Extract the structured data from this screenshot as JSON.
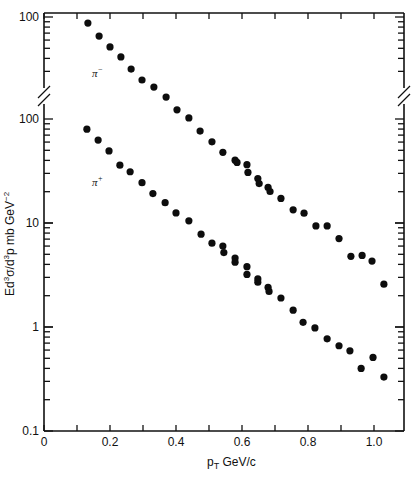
{
  "chart_data": {
    "type": "scatter",
    "title": "",
    "xlabel": "p_T GeV/c",
    "xlabel_display": "pT GeV/c",
    "ylabel": "Ed³σ/d³p mb GeV⁻²",
    "x_scale": "linear",
    "y_scale": "log",
    "xlim": [
      0,
      1.1
    ],
    "ylim": [
      0.1,
      100
    ],
    "x_ticks": [
      0,
      0.2,
      0.4,
      0.6,
      0.8,
      1.0
    ],
    "x_tick_labels": [
      "0",
      "0.2",
      "0.4",
      "0.6",
      "0.8",
      "1.0"
    ],
    "y_ticks_lower_panel": [
      0.1,
      1,
      10,
      100
    ],
    "y_tick_labels_lower_panel": [
      "0.1",
      "1",
      "10",
      "100"
    ],
    "y_tick_labels_upper_panel": [
      "100"
    ],
    "axis_break": "broken y-axis between upper panel (π⁻) and lower panel; π⁻ curve is plotted on a scale shifted one decade up (upper '100' label)",
    "grid": false,
    "legend": "none (series labelled inline)",
    "annotations": [
      {
        "text": "π⁻",
        "near": "upper curve at pT≈0.15"
      },
      {
        "text": "π⁺",
        "near": "lower curve at pT≈0.15"
      }
    ],
    "series": [
      {
        "name": "π⁻",
        "label": "π⁻",
        "note": "values read on the upper (offset) axis scale",
        "x": [
          0.133,
          0.167,
          0.2,
          0.233,
          0.264,
          0.297,
          0.333,
          0.37,
          0.403,
          0.439,
          0.473,
          0.509,
          0.542,
          0.579,
          0.585,
          0.615,
          0.618,
          0.648,
          0.652,
          0.679,
          0.685,
          0.718,
          0.755,
          0.788,
          0.824,
          0.858,
          0.894,
          0.93,
          0.964,
          0.994,
          1.03
        ],
        "y": [
          87.5,
          65.6,
          51.5,
          41.3,
          31.6,
          24.8,
          21.2,
          17.0,
          12.8,
          10.7,
          8.0,
          6.3,
          5.0,
          4.2,
          4.0,
          3.8,
          3.2,
          2.8,
          2.5,
          2.3,
          2.1,
          1.8,
          1.4,
          1.3,
          0.98,
          0.98,
          0.74,
          0.5,
          0.51,
          0.45,
          0.27
        ]
      },
      {
        "name": "π⁺",
        "label": "π⁺",
        "note": "values read on the lower axis scale",
        "x": [
          0.13,
          0.164,
          0.197,
          0.23,
          0.261,
          0.297,
          0.33,
          0.367,
          0.4,
          0.439,
          0.476,
          0.509,
          0.542,
          0.545,
          0.579,
          0.579,
          0.615,
          0.615,
          0.648,
          0.648,
          0.679,
          0.682,
          0.718,
          0.755,
          0.785,
          0.821,
          0.858,
          0.894,
          0.927,
          0.961,
          0.997,
          1.03
        ],
        "y": [
          79.9,
          62.7,
          49.3,
          36.0,
          31.1,
          24.4,
          19.2,
          15.7,
          12.5,
          10.5,
          7.8,
          6.4,
          6.0,
          5.2,
          4.6,
          4.2,
          3.8,
          3.2,
          2.9,
          2.7,
          2.4,
          2.2,
          1.9,
          1.45,
          1.11,
          0.98,
          0.77,
          0.66,
          0.59,
          0.4,
          0.51,
          0.33
        ]
      }
    ]
  },
  "labels": {
    "x_axis_title_main": "p",
    "x_axis_title_sub": "T",
    "x_axis_title_rest": " GeV/c",
    "y_axis_title_E": "Ed",
    "y_axis_title_sup1": "3",
    "y_axis_title_mid": "σ/d",
    "y_axis_title_sup2": "3",
    "y_axis_title_rest": "p mb GeV",
    "y_axis_title_sup3": "−2",
    "pi_minus": "π",
    "pi_minus_sup": "−",
    "pi_plus": "π",
    "pi_plus_sup": "+",
    "upper_100": "100"
  }
}
